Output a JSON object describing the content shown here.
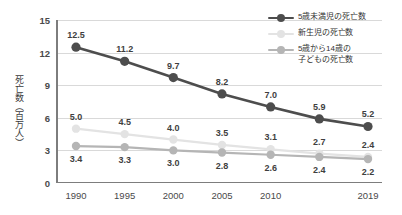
{
  "chart_data": {
    "type": "line",
    "title": "",
    "xlabel": "",
    "ylabel": "死亡数（百万人）",
    "ylim": [
      0,
      15
    ],
    "yticks": [
      "0",
      "3",
      "6",
      "9",
      "12",
      "15"
    ],
    "ytick_values": [
      0,
      3,
      6,
      9,
      12,
      15
    ],
    "grid": true,
    "legend_position": "top-right",
    "categories": [
      "1990",
      "1994",
      "1998",
      "2002",
      "2006",
      "2011",
      "2019"
    ],
    "xtick_labels": [
      "1990",
      "1995",
      "2000",
      "2005",
      "2010",
      "2019"
    ],
    "xtick_positions": [
      0,
      1,
      2,
      3,
      4,
      6
    ],
    "series": [
      {
        "name": "5歳未満児の死亡数",
        "color": "#4d4d4d",
        "values": [
          12.5,
          11.2,
          9.7,
          8.2,
          7.0,
          5.9,
          5.2
        ],
        "labels": [
          "12.5",
          "11.2",
          "9.7",
          "8.2",
          "7.0",
          "5.9",
          "5.2"
        ],
        "label_side": "above"
      },
      {
        "name": "新生児の死亡数",
        "color": "#e3e3e3",
        "values": [
          5.0,
          4.5,
          4.0,
          3.5,
          3.1,
          2.7,
          2.4
        ],
        "labels": [
          "5.0",
          "4.5",
          "4.0",
          "3.5",
          "3.1",
          "2.7",
          "2.4"
        ],
        "label_side": "above"
      },
      {
        "name": "5歳から14歳の子どもの死亡数",
        "color": "#b5b5b5",
        "values": [
          3.4,
          3.3,
          3.0,
          2.8,
          2.6,
          2.4,
          2.2
        ],
        "labels": [
          "3.4",
          "3.3",
          "3.0",
          "2.8",
          "2.6",
          "2.4",
          "2.2"
        ],
        "label_side": "below"
      }
    ]
  },
  "legend": {
    "entries": [
      {
        "label_lines": [
          "5歳未満児の死亡数"
        ],
        "color": "#4d4d4d"
      },
      {
        "label_lines": [
          "新生児の死亡数"
        ],
        "color": "#e3e3e3"
      },
      {
        "label_lines": [
          "5歳から14歳の",
          "子どもの死亡数"
        ],
        "color": "#b5b5b5"
      }
    ]
  },
  "colors": {
    "axis": "#7d7d7d",
    "gridline": "#d9d9d9",
    "text": "#4a4a4a",
    "background": "#ffffff"
  }
}
